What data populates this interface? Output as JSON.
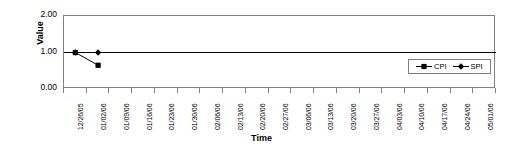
{
  "chart_data": {
    "type": "line",
    "title": "",
    "xlabel": "Time",
    "ylabel": "Value",
    "ylim": [
      0.0,
      2.0
    ],
    "yticks": [
      "0.00",
      "1.00",
      "2.00"
    ],
    "ytick_values": [
      0.0,
      1.0,
      2.0
    ],
    "grid": false,
    "legend_position": "inside-right",
    "categories": [
      "12/26/05",
      "01/02/06",
      "01/09/06",
      "01/16/06",
      "01/23/06",
      "01/30/06",
      "02/06/06",
      "02/13/06",
      "02/20/06",
      "02/27/06",
      "03/06/06",
      "03/13/06",
      "03/20/06",
      "03/27/06",
      "04/03/06",
      "04/10/06",
      "04/17/06",
      "04/24/06",
      "05/01/06"
    ],
    "series": [
      {
        "name": "CPI",
        "marker": "square",
        "color": "#000000",
        "values": [
          1.0,
          0.65,
          null,
          null,
          null,
          null,
          null,
          null,
          null,
          null,
          null,
          null,
          null,
          null,
          null,
          null,
          null,
          null,
          null
        ]
      },
      {
        "name": "SPI",
        "marker": "diamond",
        "color": "#000000",
        "values": [
          1.0,
          1.0,
          null,
          null,
          null,
          null,
          null,
          null,
          null,
          null,
          null,
          null,
          null,
          null,
          null,
          null,
          null,
          null,
          null
        ]
      }
    ]
  },
  "legend": {
    "entries": [
      {
        "label": "CPI",
        "marker": "square"
      },
      {
        "label": "SPI",
        "marker": "diamond"
      }
    ]
  },
  "axes": {
    "y_title": "Value",
    "x_title": "Time"
  }
}
